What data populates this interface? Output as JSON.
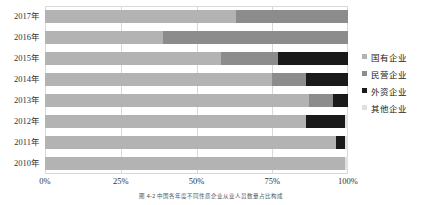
{
  "chart_data": {
    "type": "bar",
    "orientation": "horizontal",
    "stacked": true,
    "normalized": true,
    "title": "",
    "xlabel": "",
    "ylabel": "",
    "xlim": [
      0,
      100
    ],
    "grid": true,
    "legend_position": "right",
    "categories": [
      "2017年",
      "2016年",
      "2015年",
      "2014年",
      "2013年",
      "2012年",
      "2011年",
      "2010年"
    ],
    "xticks": [
      "0%",
      "25%",
      "50%",
      "75%",
      "100%"
    ],
    "xtick_values": [
      0,
      25,
      50,
      75,
      100
    ],
    "series": [
      {
        "name": "国有企业",
        "color": "#b3b3b3",
        "values": [
          63,
          39,
          58,
          75,
          87,
          86,
          96,
          99
        ]
      },
      {
        "name": "民营企业",
        "color": "#8c8c8c",
        "values": [
          37,
          61,
          19,
          11,
          8,
          0,
          0,
          0
        ]
      },
      {
        "name": "外资企业",
        "color": "#1a1a1a",
        "values": [
          0,
          0,
          23,
          14,
          5,
          13,
          3,
          0
        ]
      },
      {
        "name": "其他企业",
        "color": "#e0e0e0",
        "values": [
          0,
          0,
          0,
          0,
          0,
          1,
          1,
          1
        ]
      }
    ]
  },
  "legend": {
    "items": [
      {
        "label": "国有企业",
        "color": "#b3b3b3"
      },
      {
        "label": "民营企业",
        "color": "#8c8c8c"
      },
      {
        "label": "外资企业",
        "color": "#1a1a1a"
      },
      {
        "label": "其他企业",
        "color": "#e0e0e0"
      }
    ]
  },
  "caption": {
    "text": "图 4-2  中国各年度不同性质企业从业人员数量占比构成"
  },
  "colors": {
    "gridline": "#d9d9d9",
    "axis_text": "#333333",
    "plot_background": "#ffffff"
  }
}
